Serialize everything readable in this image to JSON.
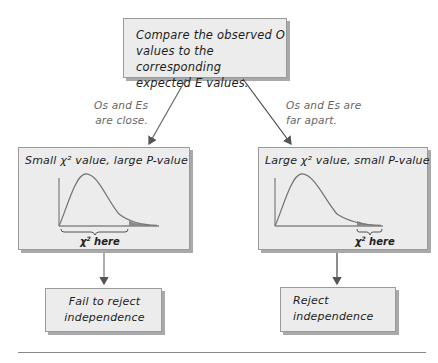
{
  "top_box": {
    "line1": "Compare the observed O",
    "line2": "values to the corresponding",
    "line3": "expected E values."
  },
  "branch_left": {
    "label_line1": "Os and Es",
    "label_line2": "are close.",
    "title": "Small χ² value, large P-value",
    "chi_label": "χ",
    "chi_sup": "2",
    "chi_here": " here",
    "result_line1": "Fail to reject",
    "result_line2": "independence"
  },
  "branch_right": {
    "label_line1": "Os and Es are",
    "label_line2": "far apart.",
    "title": "Large χ² value, small P-value",
    "chi_label": "χ",
    "chi_sup": "2",
    "chi_here": " here",
    "result_line1": "Reject",
    "result_line2": "independence"
  },
  "colors": {
    "box_fill": "#ececec",
    "box_border": "#9a9a9a",
    "curve": "#777777",
    "tail_fill": "#8a8a8a",
    "arrow": "#555555"
  }
}
